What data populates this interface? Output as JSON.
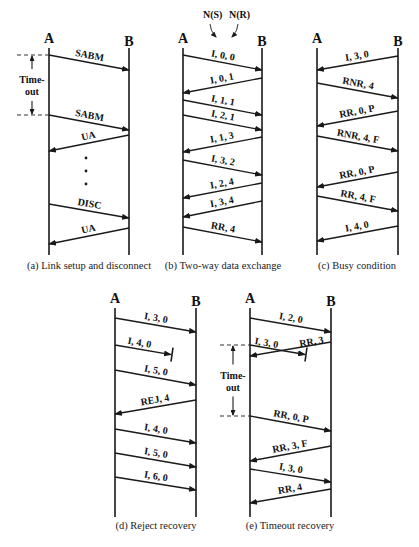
{
  "figure": {
    "width": 419,
    "height": 547,
    "colors": {
      "line": "#1a1a1a",
      "dash": "#333333",
      "text": "#111111"
    }
  },
  "panels": [
    {
      "id": "a",
      "caption": "(a) Link setup and disconnect",
      "caption_x": 89,
      "caption_y": 269,
      "a_x": 49,
      "b_x": 129,
      "top": 48,
      "bottom": 255,
      "station_a": "A",
      "station_b": "B",
      "messages": [
        {
          "label": "SABM",
          "dir": "AtoB",
          "y1": 55,
          "y2": 70
        },
        {
          "label": "SABM",
          "dir": "AtoB",
          "y1": 115,
          "y2": 130
        },
        {
          "label": "UA",
          "dir": "BtoA",
          "y1": 135,
          "y2": 151
        },
        {
          "label": "DISC",
          "dir": "AtoB",
          "y1": 204,
          "y2": 218
        },
        {
          "label": "UA",
          "dir": "BtoA",
          "y1": 228,
          "y2": 244
        }
      ],
      "dots": [
        {
          "x": 86,
          "y": 158
        },
        {
          "x": 86,
          "y": 171
        },
        {
          "x": 86,
          "y": 184
        }
      ],
      "timeout": {
        "label1": "Time-",
        "label2": "out",
        "x": 32,
        "y_top": 55,
        "y_bot": 115,
        "dash_x1": 17,
        "dash_x2": 49
      }
    },
    {
      "id": "b",
      "caption": "(b) Two-way data exchange",
      "caption_x": 223,
      "caption_y": 269,
      "a_x": 183,
      "b_x": 262,
      "top": 48,
      "bottom": 255,
      "station_a": "A",
      "station_b": "B",
      "messages": [
        {
          "label": "I, 0, 0",
          "dir": "AtoB",
          "y1": 55,
          "y2": 70
        },
        {
          "label": "I, 0, 1",
          "dir": "BtoA",
          "y1": 78,
          "y2": 93
        },
        {
          "label": "I, 1, 1",
          "dir": "AtoB",
          "y1": 100,
          "y2": 115
        },
        {
          "label": "I, 2, 1",
          "dir": "AtoB",
          "y1": 115,
          "y2": 130
        },
        {
          "label": "I, 1, 3",
          "dir": "BtoA",
          "y1": 137,
          "y2": 152
        },
        {
          "label": "I, 3, 2",
          "dir": "AtoB",
          "y1": 160,
          "y2": 175
        },
        {
          "label": "I, 2, 4",
          "dir": "BtoA",
          "y1": 183,
          "y2": 198
        },
        {
          "label": "I, 3, 4",
          "dir": "BtoA",
          "y1": 201,
          "y2": 217
        },
        {
          "label": "RR, 4",
          "dir": "AtoB",
          "y1": 227,
          "y2": 242
        }
      ],
      "annotations": [
        {
          "label": "N(S)",
          "x": 203,
          "y": 18,
          "px1": 210,
          "py1": 24,
          "px2": 216,
          "py2": 37
        },
        {
          "label": "N(R)",
          "x": 229,
          "y": 18,
          "px1": 238,
          "py1": 24,
          "px2": 232,
          "py2": 37
        }
      ]
    },
    {
      "id": "c",
      "caption": "(c) Busy condition",
      "caption_x": 357,
      "caption_y": 269,
      "a_x": 317,
      "b_x": 398,
      "top": 48,
      "bottom": 255,
      "station_a": "A",
      "station_b": "B",
      "messages": [
        {
          "label": "I, 3, 0",
          "dir": "BtoA",
          "y1": 56,
          "y2": 70
        },
        {
          "label": "RNR, 4",
          "dir": "AtoB",
          "y1": 83,
          "y2": 98
        },
        {
          "label": "RR, 0, P",
          "dir": "BtoA",
          "y1": 111,
          "y2": 126
        },
        {
          "label": "RNR, 4, F",
          "dir": "AtoB",
          "y1": 136,
          "y2": 151
        },
        {
          "label": "RR, 0, P",
          "dir": "BtoA",
          "y1": 172,
          "y2": 187
        },
        {
          "label": "RR, 4, F",
          "dir": "AtoB",
          "y1": 196,
          "y2": 211
        },
        {
          "label": "I, 4, 0",
          "dir": "BtoA",
          "y1": 226,
          "y2": 241
        }
      ]
    },
    {
      "id": "d",
      "caption": "(d) Reject recovery",
      "caption_x": 156,
      "caption_y": 529,
      "a_x": 115,
      "b_x": 196,
      "top": 308,
      "bottom": 517,
      "station_a": "A",
      "station_b": "B",
      "messages": [
        {
          "label": "I, 3, 0",
          "dir": "AtoB",
          "y1": 318,
          "y2": 332
        },
        {
          "label": "I, 4, 0",
          "dir": "AtoB",
          "y1": 345,
          "y2": 355,
          "lost_at": 171
        },
        {
          "label": "I, 5, 0",
          "dir": "AtoB",
          "y1": 370,
          "y2": 385
        },
        {
          "label": "REJ, 4",
          "dir": "BtoA",
          "y1": 400,
          "y2": 414
        },
        {
          "label": "I, 4, 0",
          "dir": "AtoB",
          "y1": 429,
          "y2": 443
        },
        {
          "label": "I, 5, 0",
          "dir": "AtoB",
          "y1": 453,
          "y2": 467
        },
        {
          "label": "I, 6, 0",
          "dir": "AtoB",
          "y1": 477,
          "y2": 490
        }
      ]
    },
    {
      "id": "e",
      "caption": "(e) Timeout recovery",
      "caption_x": 290,
      "caption_y": 529,
      "a_x": 250,
      "b_x": 331,
      "top": 308,
      "bottom": 517,
      "station_a": "A",
      "station_b": "B",
      "messages": [
        {
          "label": "I, 2, 0",
          "dir": "AtoB",
          "y1": 318,
          "y2": 332
        },
        {
          "label": "I, 3, 0",
          "dir": "AtoB",
          "y1": 345,
          "y2": 355,
          "lost_at": 305
        },
        {
          "label": "RR, 3",
          "dir": "BtoA",
          "y1": 342,
          "y2": 356
        },
        {
          "label": "RR, 0, P",
          "dir": "AtoB",
          "y1": 416,
          "y2": 431
        },
        {
          "label": "RR, 3, F",
          "dir": "BtoA",
          "y1": 446,
          "y2": 461
        },
        {
          "label": "I, 3, 0",
          "dir": "AtoB",
          "y1": 469,
          "y2": 482
        },
        {
          "label": "RR, 4",
          "dir": "BtoA",
          "y1": 489,
          "y2": 503
        }
      ],
      "timeout": {
        "label1": "Time-",
        "label2": "out",
        "x": 233,
        "y_top": 345,
        "y_bot": 416,
        "dash_x1": 220,
        "dash_x2": 250
      }
    }
  ]
}
